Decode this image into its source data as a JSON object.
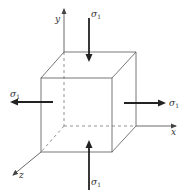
{
  "diagram": {
    "type": "stress-element-cube",
    "axes": {
      "x_label": "x",
      "y_label": "y",
      "z_label": "z"
    },
    "stresses": [
      {
        "id": "top",
        "symbol": "σ",
        "subscript": "1",
        "direction": "down"
      },
      {
        "id": "left",
        "symbol": "σ",
        "subscript": "1",
        "direction": "left"
      },
      {
        "id": "right",
        "symbol": "σ",
        "subscript": "1",
        "direction": "right"
      },
      {
        "id": "bottom",
        "symbol": "σ",
        "subscript": "1",
        "direction": "up"
      }
    ],
    "colors": {
      "line": "#555555",
      "arrow": "#222222",
      "background": "#ffffff"
    }
  }
}
